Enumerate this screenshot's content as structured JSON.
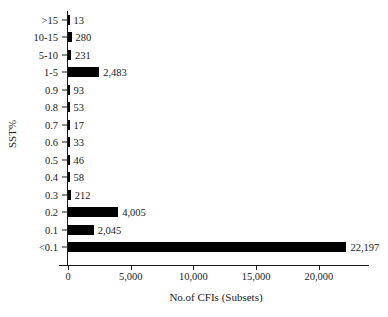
{
  "chart_data": {
    "type": "bar",
    "orientation": "horizontal",
    "title": "",
    "xlabel": "No.of CFIs (Subsets)",
    "ylabel": "SST%",
    "categories": [
      ">15",
      "10-15",
      "5-10",
      "1-5",
      "0.9",
      "0.8",
      "0.7",
      "0.6",
      "0.5",
      "0.4",
      "0.3",
      "0.2",
      "0.1",
      "<0.1"
    ],
    "values": [
      13,
      280,
      231,
      2483,
      93,
      53,
      17,
      33,
      46,
      58,
      212,
      4005,
      2045,
      22197
    ],
    "value_labels": [
      "13",
      "280",
      "231",
      "2,483",
      "93",
      "53",
      "17",
      "33",
      "46",
      "58",
      "212",
      "4,005",
      "2,045",
      "22,197"
    ],
    "xlim": [
      0,
      24000
    ],
    "xticks": [
      0,
      5000,
      10000,
      15000,
      20000
    ],
    "xtick_labels": [
      "0",
      "5,000",
      "10,000",
      "15,000",
      "20,000"
    ],
    "grid": false,
    "legend": false,
    "bar_color": "#000000",
    "axis_color": "#1a1a1a",
    "background": "#ffffff"
  }
}
